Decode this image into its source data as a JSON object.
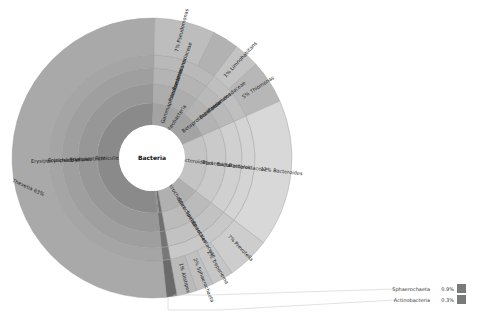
{
  "chart_data": {
    "type": "sunburst",
    "title": "",
    "root": "Bacteria",
    "rings": [
      {
        "level": 1,
        "segments": [
          {
            "name": "Firmicutes",
            "start_pct": 0,
            "end_pct": 52,
            "shade": "#8a8a8a",
            "show_label": true
          },
          {
            "name": "Proteobacteria",
            "start_pct": 52,
            "end_pct": 70,
            "shade": "#a3a3a3",
            "show_label": true
          },
          {
            "name": "Bacteroidetes",
            "start_pct": 70,
            "end_pct": 87,
            "shade": "#c4c4c4",
            "show_label": true
          },
          {
            "name": "Spirochaetes",
            "start_pct": 87,
            "end_pct": 98.8,
            "shade": "#b0b0b0",
            "show_label": true
          },
          {
            "name": "Sphaerochaeta",
            "start_pct": 98.8,
            "end_pct": 99.7,
            "shade": "#6e6e6e",
            "show_label": false
          },
          {
            "name": "Actinobacteria",
            "start_pct": 99.7,
            "end_pct": 100,
            "shade": "#7a7a7a",
            "show_label": false
          }
        ]
      },
      {
        "level": 2,
        "segments": [
          {
            "name": "Erysipelotrichi",
            "start_pct": 0,
            "end_pct": 52,
            "shade": "#979797",
            "show_label": true
          },
          {
            "name": "Gammaproteobacteria",
            "start_pct": 52,
            "end_pct": 62,
            "shade": "#adadad",
            "show_label": true
          },
          {
            "name": "Betaproteobacteria",
            "start_pct": 62,
            "end_pct": 70,
            "shade": "#b3b3b3",
            "show_label": true
          },
          {
            "name": "Bacteroidia",
            "start_pct": 70,
            "end_pct": 87,
            "shade": "#cacaca",
            "show_label": true
          },
          {
            "name": "Spirochaetes",
            "start_pct": 87,
            "end_pct": 98.8,
            "shade": "#bbbbbb",
            "show_label": true
          },
          {
            "name": "Sphaerochaeta",
            "start_pct": 98.8,
            "end_pct": 100,
            "shade": "#707070",
            "show_label": false
          }
        ]
      },
      {
        "level": 3,
        "segments": [
          {
            "name": "Erysipelotrichales",
            "start_pct": 0,
            "end_pct": 52,
            "shade": "#9f9f9f",
            "show_label": true
          },
          {
            "name": "Pseudomonadales",
            "start_pct": 52,
            "end_pct": 62,
            "shade": "#b4b4b4",
            "show_label": true
          },
          {
            "name": "Burkholderiales",
            "start_pct": 62,
            "end_pct": 70,
            "shade": "#b9b9b9",
            "show_label": true
          },
          {
            "name": "Bacteroidales",
            "start_pct": 70,
            "end_pct": 87,
            "shade": "#d0d0d0",
            "show_label": true
          },
          {
            "name": "Spirochaetales",
            "start_pct": 87,
            "end_pct": 98.8,
            "shade": "#c2c2c2",
            "show_label": true
          },
          {
            "name": "Sphaerochaetales",
            "start_pct": 98.8,
            "end_pct": 100,
            "shade": "#747474",
            "show_label": false
          }
        ]
      },
      {
        "level": 4,
        "segments": [
          {
            "name": "Erysipelotrichaceae",
            "start_pct": 0,
            "end_pct": 52,
            "shade": "#a5a5a5",
            "show_label": true
          },
          {
            "name": "Pseudomonadaceae",
            "start_pct": 52,
            "end_pct": 62,
            "shade": "#b9b9b9",
            "show_label": true
          },
          {
            "name": "Comamonadaceae",
            "start_pct": 62,
            "end_pct": 70,
            "shade": "#bfbfbf",
            "show_label": true
          },
          {
            "name": "Bacteroidaceae",
            "start_pct": 70,
            "end_pct": 87,
            "shade": "#d4d4d4",
            "show_label": true
          },
          {
            "name": "Spirochaetaceae",
            "start_pct": 87,
            "end_pct": 98.8,
            "shade": "#c8c8c8",
            "show_label": true
          },
          {
            "name": "Sphaerochaetaceae",
            "start_pct": 98.8,
            "end_pct": 100,
            "shade": "#787878",
            "show_label": false
          }
        ]
      },
      {
        "level": 5,
        "segments": [
          {
            "name": "Thevetia",
            "pct": 63,
            "label": "Thevetia  63%",
            "start_pct": 0,
            "end_pct": 52,
            "shade": "#a9a9a9"
          },
          {
            "name": "Pseudomonas",
            "pct": 7,
            "label": "7%  Pseudomonas",
            "start_pct": 52,
            "end_pct": 59,
            "shade": "#bdbdbd"
          },
          {
            "name": "Comamonas",
            "pct": 1,
            "label": "",
            "start_pct": 59,
            "end_pct": 62,
            "shade": "#b2b2b2"
          },
          {
            "name": "Limnohabitans",
            "pct": 1,
            "label": "1%  Limnohabitans",
            "start_pct": 62,
            "end_pct": 65,
            "shade": "#c3c3c3"
          },
          {
            "name": "Thiomonas",
            "pct": 5,
            "label": "5%  Thiomonas",
            "start_pct": 65,
            "end_pct": 70,
            "shade": "#b7b7b7"
          },
          {
            "name": "Bacteroides",
            "pct": 12,
            "label": "12%  Bacteroides",
            "start_pct": 70,
            "end_pct": 87,
            "shade": "#d8d8d8"
          },
          {
            "name": "Prevotella",
            "pct": 7,
            "label": "7%  Prevotella",
            "start_pct": 87,
            "end_pct": 92,
            "shade": "#cdcdcd"
          },
          {
            "name": "Treponema",
            "pct": 2,
            "label": "2%  Treponema",
            "start_pct": 92,
            "end_pct": 94.5,
            "shade": "#c6c6c6"
          },
          {
            "name": "Sphaerochaeta",
            "pct": 2,
            "label": "2%  Sphaerochaeta",
            "start_pct": 94.5,
            "end_pct": 96.5,
            "shade": "#c0c0c0"
          },
          {
            "name": "Alistipes",
            "pct": 1,
            "label": "1%  Alistipes",
            "start_pct": 96.5,
            "end_pct": 98.8,
            "shade": "#bababa"
          },
          {
            "name": "Other",
            "pct": 1,
            "label": "",
            "start_pct": 98.8,
            "end_pct": 100,
            "shade": "#6a6a6a"
          }
        ]
      }
    ],
    "legend": [
      {
        "name": "Sphaerochaeta",
        "value": "0.9%",
        "color": "#7a7a7a"
      },
      {
        "name": "Actinobacteria",
        "value": "0.3%",
        "color": "#7a7a7a"
      }
    ]
  }
}
